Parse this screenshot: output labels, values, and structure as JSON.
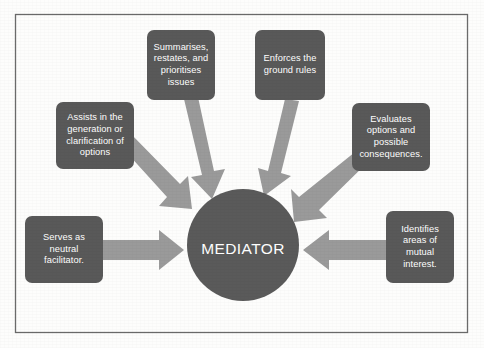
{
  "diagram": {
    "title": "MEDIATOR",
    "center": {
      "label": "MEDIATOR",
      "shape": "circle",
      "fill": "#5a5a5a",
      "text_color": "#ffffff"
    },
    "frame": {
      "border_color": "#6b6b6b",
      "background": "#fdfdfc"
    },
    "arrow_color": "#9a9a9a",
    "node_fill": "#595959",
    "node_text_color": "#ffffff",
    "nodes": [
      {
        "id": "summarises",
        "label": "Summarises, restates, and prioritises issues",
        "lines": [
          "Summarises,",
          "restates, and",
          "prioritises",
          "issues"
        ],
        "position": "top-left-inner",
        "arrow_direction": "down-right"
      },
      {
        "id": "ground-rules",
        "label": "Enforces the ground rules",
        "lines": [
          "Enforces the",
          "ground rules"
        ],
        "position": "top-right-inner",
        "arrow_direction": "down-left"
      },
      {
        "id": "options-generation",
        "label": "Assists in the generation or clarification of options",
        "lines": [
          "Assists in the",
          "generation or",
          "clarification of",
          "options"
        ],
        "position": "upper-left",
        "arrow_direction": "down-right"
      },
      {
        "id": "evaluates-options",
        "label": "Evaluates options and possible consequences.",
        "lines": [
          "Evaluates",
          "options and",
          "possible",
          "consequences."
        ],
        "position": "upper-right",
        "arrow_direction": "down-left"
      },
      {
        "id": "neutral-facilitator",
        "label": "Serves as neutral facilitator.",
        "lines": [
          "Serves as",
          "neutral",
          "facilitator."
        ],
        "position": "left",
        "arrow_direction": "right"
      },
      {
        "id": "mutual-interest",
        "label": "Identifies areas of mutual interest.",
        "lines": [
          "Identifies",
          "areas of",
          "mutual",
          "interest."
        ],
        "position": "right",
        "arrow_direction": "left"
      }
    ]
  }
}
